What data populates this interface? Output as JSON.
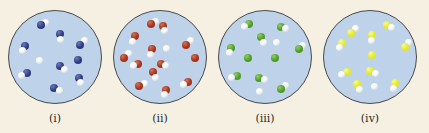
{
  "figure": {
    "background": "#f5f0e1",
    "circle_fill": "#bed3ea",
    "panels": [
      {
        "label": "(i)",
        "left": 2,
        "color": "#2e3a7a",
        "highlight": "#6a78c0",
        "molecules": [
          {
            "x": 35,
            "y": 16,
            "h": [
              {
                "dx": 5,
                "dy": -3
              }
            ]
          },
          {
            "x": 55,
            "y": 26,
            "h": [
              {
                "dx": 1,
                "dy": 5
              }
            ]
          },
          {
            "x": 18,
            "y": 38,
            "h": [
              {
                "dx": -2,
                "dy": 5
              }
            ]
          },
          {
            "x": 77,
            "y": 37,
            "h": [
              {
                "dx": 4,
                "dy": -4
              }
            ]
          },
          {
            "x": 34,
            "y": 54,
            "single_h": true
          },
          {
            "x": 55,
            "y": 60,
            "h": [
              {
                "dx": 5,
                "dy": 3
              }
            ]
          },
          {
            "x": 74,
            "y": 53,
            "h": []
          },
          {
            "x": 20,
            "y": 67,
            "h": [
              {
                "dx": -5,
                "dy": 3
              }
            ]
          },
          {
            "x": 75,
            "y": 72,
            "h": [
              {
                "dx": 2,
                "dy": 5
              }
            ]
          },
          {
            "x": 49,
            "y": 83,
            "h": [
              {
                "dx": 5,
                "dy": 2
              }
            ]
          }
        ]
      },
      {
        "label": "(ii)",
        "left": 107,
        "color": "#a2331d",
        "highlight": "#d8704f",
        "molecules": [
          {
            "x": 40,
            "y": 15,
            "h": [
              {
                "dx": 5,
                "dy": -3
              }
            ]
          },
          {
            "x": 53,
            "y": 17,
            "h": [
              {
                "dx": 2,
                "dy": 5
              }
            ]
          },
          {
            "x": 23,
            "y": 28,
            "h": [
              {
                "dx": -2,
                "dy": 5
              }
            ]
          },
          {
            "x": 41,
            "y": 42,
            "h": [
              {
                "dx": -1,
                "dy": 5
              }
            ]
          },
          {
            "x": 57,
            "y": 41,
            "single_h": true
          },
          {
            "x": 78,
            "y": 37,
            "h": [
              {
                "dx": 4,
                "dy": -4
              }
            ]
          },
          {
            "x": 12,
            "y": 51,
            "h": [
              {
                "dx": 4,
                "dy": -4
              }
            ]
          },
          {
            "x": 27,
            "y": 57,
            "h": [
              {
                "dx": -5,
                "dy": 2
              }
            ]
          },
          {
            "x": 51,
            "y": 57,
            "h": [
              {
                "dx": 5,
                "dy": 2
              }
            ]
          },
          {
            "x": 87,
            "y": 51,
            "h": []
          },
          {
            "x": 43,
            "y": 66,
            "h": [
              {
                "dx": 2,
                "dy": 5
              }
            ]
          },
          {
            "x": 28,
            "y": 81,
            "h": [
              {
                "dx": 5,
                "dy": -3
              }
            ]
          },
          {
            "x": 80,
            "y": 77,
            "h": [
              {
                "dx": -5,
                "dy": 2
              }
            ]
          },
          {
            "x": 56,
            "y": 85,
            "h": [
              {
                "dx": -1,
                "dy": 5
              }
            ]
          }
        ]
      },
      {
        "label": "(iii)",
        "left": 212,
        "color": "#4f9a2c",
        "highlight": "#8fd060",
        "molecules": [
          {
            "x": 33,
            "y": 15,
            "h": [
              {
                "dx": -5,
                "dy": 2
              }
            ]
          },
          {
            "x": 67,
            "y": 18,
            "h": [
              {
                "dx": 5,
                "dy": 2
              }
            ]
          },
          {
            "x": 46,
            "y": 29,
            "h": [
              {
                "dx": 2,
                "dy": 5
              }
            ]
          },
          {
            "x": 62,
            "y": 35,
            "single_h": true
          },
          {
            "x": 14,
            "y": 40,
            "h": [
              {
                "dx": -2,
                "dy": 5
              }
            ]
          },
          {
            "x": 86,
            "y": 42,
            "h": [
              {
                "dx": 4,
                "dy": -4
              }
            ]
          },
          {
            "x": 32,
            "y": 51,
            "h": []
          },
          {
            "x": 61,
            "y": 51,
            "h": []
          },
          {
            "x": 20,
            "y": 70,
            "h": [
              {
                "dx": -5,
                "dy": 2
              }
            ]
          },
          {
            "x": 44,
            "y": 72,
            "h": [
              {
                "dx": 5,
                "dy": 2
              }
            ]
          },
          {
            "x": 44,
            "y": 87,
            "single_h": true
          },
          {
            "x": 67,
            "y": 84,
            "h": [
              {
                "dx": 5,
                "dy": -3
              }
            ]
          }
        ]
      },
      {
        "label": "(iv)",
        "left": 317,
        "color": "#e2e82a",
        "highlight": "#f7fa9a",
        "molecules": [
          {
            "x": 30,
            "y": 24,
            "h": [
              {
                "dx": 4,
                "dy": -4
              }
            ]
          },
          {
            "x": 68,
            "y": 16,
            "h": [
              {
                "dx": 5,
                "dy": 2
              }
            ]
          },
          {
            "x": 52,
            "y": 27,
            "h": [
              {
                "dx": 0,
                "dy": 5
              }
            ]
          },
          {
            "x": 20,
            "y": 35,
            "h": [
              {
                "dx": -2,
                "dy": 5
              }
            ]
          },
          {
            "x": 87,
            "y": 39,
            "h": [
              {
                "dx": 4,
                "dy": -4
              }
            ]
          },
          {
            "x": 52,
            "y": 48,
            "h": []
          },
          {
            "x": 25,
            "y": 66,
            "h": [
              {
                "dx": -5,
                "dy": 2
              }
            ]
          },
          {
            "x": 50,
            "y": 65,
            "h": [
              {
                "dx": 5,
                "dy": 2
              }
            ]
          },
          {
            "x": 36,
            "y": 79,
            "h": [
              {
                "dx": 3,
                "dy": 5
              }
            ]
          },
          {
            "x": 55,
            "y": 81,
            "single_h": true
          },
          {
            "x": 77,
            "y": 78,
            "h": [
              {
                "dx": -2,
                "dy": 5
              }
            ]
          }
        ]
      }
    ]
  }
}
